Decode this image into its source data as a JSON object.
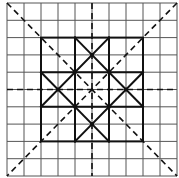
{
  "diagram": {
    "type": "grid-pattern",
    "canvas": {
      "width": 179,
      "height": 178
    },
    "grid": {
      "origin_px": [
        7,
        3
      ],
      "cols": 10,
      "rows": 10,
      "cell_w": 17,
      "cell_h": 17.3,
      "thin_color": "#555555",
      "thin_width": 1
    },
    "thick_color": "#111111",
    "thick_width": 2,
    "thick_square": {
      "from": [
        2,
        2
      ],
      "to": [
        8,
        8
      ]
    },
    "thick_lines": [
      {
        "from": [
          4,
          2
        ],
        "to": [
          4,
          8
        ]
      },
      {
        "from": [
          6,
          2
        ],
        "to": [
          6,
          8
        ]
      },
      {
        "from": [
          2,
          4
        ],
        "to": [
          8,
          4
        ]
      },
      {
        "from": [
          2,
          6
        ],
        "to": [
          8,
          6
        ]
      },
      {
        "from": [
          4,
          2
        ],
        "to": [
          8,
          6
        ]
      },
      {
        "from": [
          6,
          2
        ],
        "to": [
          2,
          6
        ]
      },
      {
        "from": [
          2,
          4
        ],
        "to": [
          6,
          8
        ]
      },
      {
        "from": [
          8,
          4
        ],
        "to": [
          4,
          8
        ]
      }
    ],
    "dashed_color": "#111111",
    "dashed_width": 1.6,
    "dash_pattern": "6,4",
    "dashed_lines": [
      {
        "name": "vertical-axis",
        "from": [
          5,
          0
        ],
        "to": [
          5,
          10
        ]
      },
      {
        "name": "horizontal-axis",
        "from": [
          0,
          5
        ],
        "to": [
          10,
          5
        ]
      },
      {
        "name": "main-diagonal",
        "from": [
          0,
          0
        ],
        "to": [
          10,
          10
        ]
      },
      {
        "name": "anti-diagonal",
        "from": [
          10,
          0
        ],
        "to": [
          0,
          10
        ]
      }
    ],
    "points": [
      [
        5,
        3
      ],
      [
        4,
        4
      ],
      [
        6,
        4
      ],
      [
        3,
        5
      ],
      [
        7,
        5
      ],
      [
        4,
        6
      ],
      [
        6,
        6
      ],
      [
        5,
        7
      ]
    ],
    "point_radius": 2
  }
}
